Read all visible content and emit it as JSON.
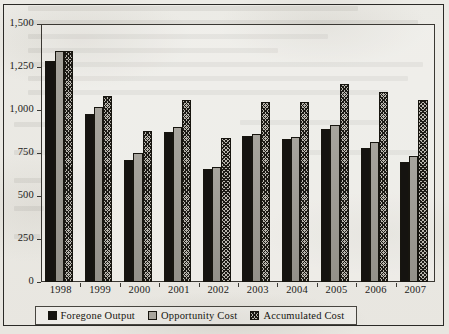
{
  "chart_data": {
    "type": "bar",
    "title": "",
    "xlabel": "",
    "ylabel": "",
    "ylim": [
      0,
      1500
    ],
    "yticks": [
      "0",
      "250",
      "500",
      "750",
      "1,000",
      "1,250",
      "1,500"
    ],
    "ytick_values": [
      0,
      250,
      500,
      750,
      1000,
      1250,
      1500
    ],
    "grid": false,
    "legend_position": "bottom",
    "categories": [
      "1998",
      "1999",
      "2000",
      "2001",
      "2002",
      "2003",
      "2004",
      "2005",
      "2006",
      "2007"
    ],
    "series": [
      {
        "name": "Foregone Output",
        "color": "#151310",
        "pattern": "solid-black",
        "values": [
          1285,
          975,
          710,
          875,
          655,
          850,
          830,
          890,
          780,
          700
        ]
      },
      {
        "name": "Opportunity Cost",
        "color": "#a8a59d",
        "pattern": "solid-gray",
        "values": [
          1345,
          1015,
          750,
          900,
          670,
          860,
          845,
          915,
          815,
          730
        ]
      },
      {
        "name": "Accumulated Cost",
        "color": "#b9b6ae",
        "pattern": "crosshatch",
        "values": [
          1345,
          1080,
          880,
          1060,
          840,
          1045,
          1045,
          1150,
          1105,
          1060
        ]
      }
    ]
  },
  "legend": {
    "items": [
      {
        "label": "Foregone Output"
      },
      {
        "label": "Opportunity Cost"
      },
      {
        "label": "Accumulated Cost"
      }
    ]
  }
}
